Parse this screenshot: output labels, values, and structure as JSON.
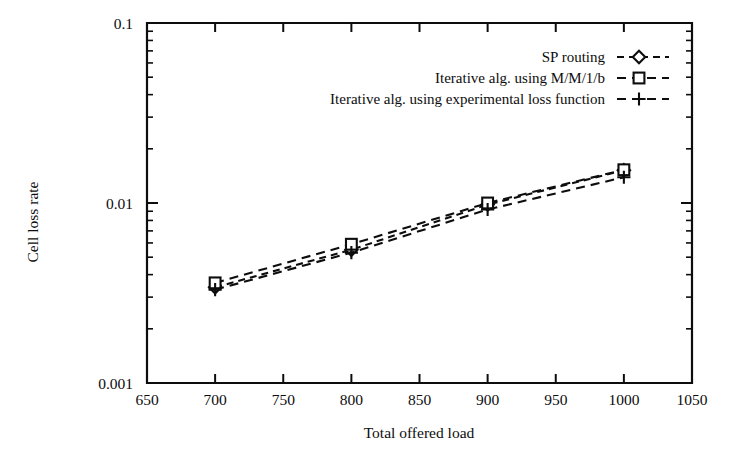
{
  "chart_data": {
    "type": "line",
    "title": "",
    "xlabel": "Total offered load",
    "ylabel": "Cell loss rate",
    "xlim": [
      650,
      1050
    ],
    "ylim": [
      0.001,
      0.1
    ],
    "yscale": "log",
    "xscale": "linear",
    "grid": false,
    "legend_position": "top-right",
    "x": [
      700,
      800,
      900,
      1000
    ],
    "xticks": [
      "650",
      "700",
      "750",
      "800",
      "850",
      "900",
      "950",
      "1000",
      "1050"
    ],
    "xtick_values": [
      650,
      700,
      750,
      800,
      850,
      900,
      950,
      1000,
      1050
    ],
    "yticks": [
      "0.001",
      "0.01",
      "0.1"
    ],
    "ytick_values": [
      0.001,
      0.01,
      0.1
    ],
    "series": [
      {
        "name": "SP routing",
        "marker": "diamond",
        "linestyle": "dotted",
        "values": [
          0.0034,
          0.0055,
          0.0098,
          0.0152
        ]
      },
      {
        "name": "Iterative alg. using M/M/1/b",
        "marker": "square",
        "linestyle": "dashed",
        "values": [
          0.0036,
          0.0059,
          0.01,
          0.0153
        ]
      },
      {
        "name": "Iterative alg. using experimental loss function",
        "marker": "plus",
        "linestyle": "dashed",
        "values": [
          0.0033,
          0.0053,
          0.0092,
          0.0139
        ]
      }
    ]
  },
  "legend": {
    "entries": [
      {
        "label": "SP routing",
        "marker_name": "diamond-marker"
      },
      {
        "label": "Iterative alg. using M/M/1/b",
        "marker_name": "square-marker"
      },
      {
        "label": "Iterative alg. using experimental loss function",
        "marker_name": "plus-marker"
      }
    ]
  },
  "colors": {
    "ink": "#0d0d0d",
    "background": "#ffffff"
  }
}
